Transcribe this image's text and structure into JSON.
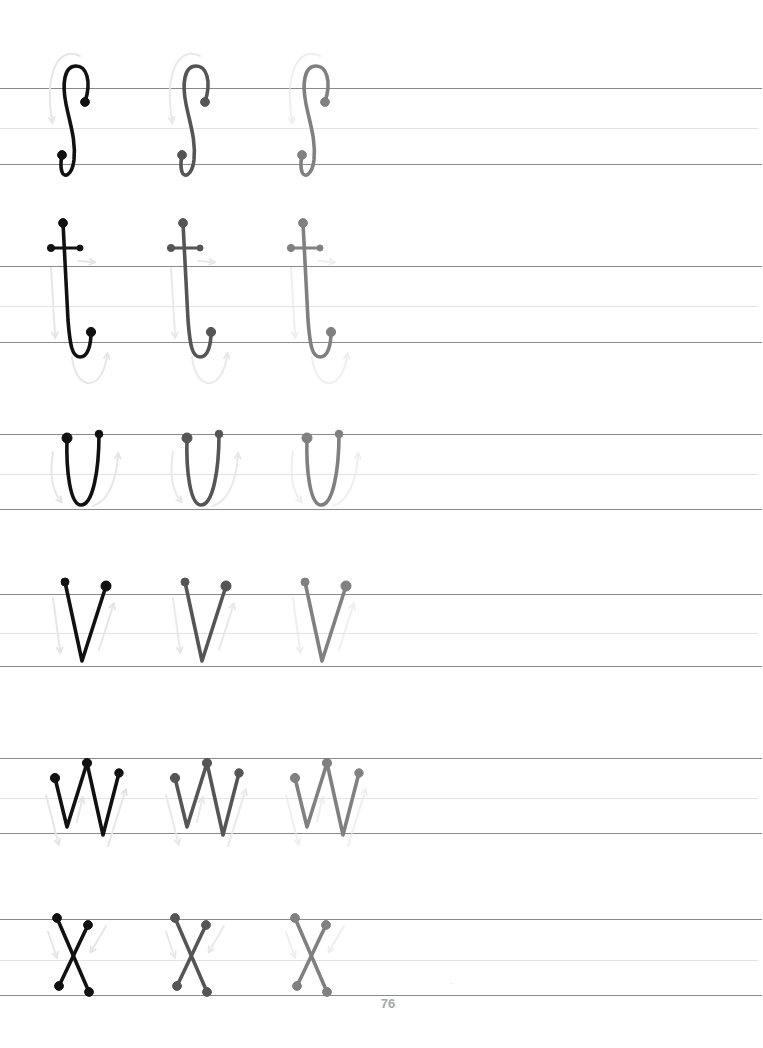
{
  "page": {
    "type": "handwriting-practice-worksheet",
    "page_number": "76",
    "background": "#ffffff"
  },
  "style": {
    "guide_line_color": "#8a8a8a",
    "mid_line_color": "#e2e2e2",
    "arrow_color": "#e4e4e4",
    "trace_colors": [
      "#111111",
      "#555555",
      "#808080"
    ],
    "copy_offsets_px": [
      0,
      120,
      240
    ]
  },
  "rows": [
    {
      "letter": "s",
      "guide_lines": {
        "top": 88,
        "mid": 128,
        "bottom": 164
      },
      "copies": 3,
      "stroke_hint": "curved arrow, counter-clockwise then down"
    },
    {
      "letter": "t",
      "guide_lines": {
        "top": 266,
        "mid": 306,
        "bottom": 342
      },
      "copies": 3,
      "stroke_hint": "down stroke, hook right, crossbar"
    },
    {
      "letter": "u",
      "guide_lines": {
        "top": 434,
        "mid": 474,
        "bottom": 509
      },
      "copies": 3,
      "stroke_hint": "down, curve, up"
    },
    {
      "letter": "v",
      "guide_lines": {
        "top": 594,
        "mid": 633,
        "bottom": 666
      },
      "copies": 3,
      "stroke_hint": "down diagonal, up diagonal"
    },
    {
      "letter": "w",
      "guide_lines": {
        "top": 758,
        "mid": 798,
        "bottom": 833
      },
      "copies": 3,
      "stroke_hint": "down, up, down, up"
    },
    {
      "letter": "x",
      "guide_lines": {
        "top": 919,
        "mid": 960,
        "bottom": 995
      },
      "copies": 3,
      "stroke_hint": "two crossing diagonals"
    }
  ]
}
